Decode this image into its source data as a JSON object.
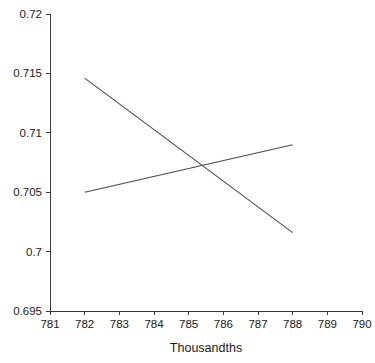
{
  "chart_data": {
    "type": "line",
    "title": "",
    "subtitle": "",
    "xlabel": "Thousandths",
    "ylabel": "",
    "xlim": [
      781,
      790
    ],
    "ylim": [
      0.695,
      0.72
    ],
    "xticks": [
      781,
      782,
      783,
      784,
      785,
      786,
      787,
      788,
      789,
      790
    ],
    "xtick_labels": [
      "781",
      "782",
      "783",
      "784",
      "785",
      "786",
      "787",
      "788",
      "789",
      "790"
    ],
    "yticks": [
      0.695,
      0.7,
      0.705,
      0.71,
      0.715,
      0.72
    ],
    "ytick_labels": [
      "0.695",
      "0.7",
      "0.705",
      "0.71",
      "0.715",
      "0.72"
    ],
    "grid": false,
    "legend": false,
    "legend_position": "none",
    "line_color": "#4a4a4a",
    "axis_color": "#3a3a3a",
    "background_color": "#ffffff",
    "series": [
      {
        "name": "descending",
        "color": "#4a4a4a",
        "x": [
          782,
          788
        ],
        "values": [
          0.7146,
          0.7016
        ]
      },
      {
        "name": "ascending",
        "color": "#4a4a4a",
        "x": [
          782,
          788
        ],
        "values": [
          0.705,
          0.709
        ]
      }
    ],
    "annotations": [
      {
        "name": "intersection",
        "x": 785.2,
        "y": 0.7072
      }
    ]
  }
}
